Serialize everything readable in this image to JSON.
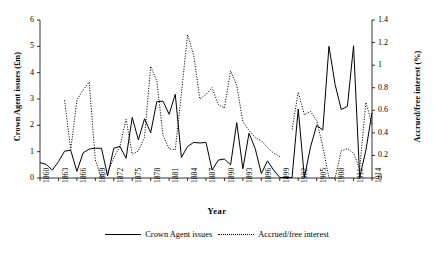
{
  "chart_data": {
    "type": "line",
    "title": "",
    "xlabel": "Year",
    "ylabel": "Crown Agent issues (£m)",
    "y2label": "Accrued/free interest (%)",
    "ylim": [
      0,
      6
    ],
    "y2lim": [
      0,
      1.4
    ],
    "xlim": [
      1860,
      1914
    ],
    "grid": false,
    "legend_position": "below",
    "y_ticks": [
      "0",
      "1",
      "2",
      "3",
      "4",
      "5",
      "6"
    ],
    "y2_ticks": [
      "0",
      "0.2",
      "0.4",
      "0.6",
      "0.8",
      "1",
      "1.2",
      "1.4"
    ],
    "x_ticks": [
      "1860",
      "1863",
      "1866",
      "1869",
      "1872",
      "1875",
      "1878",
      "1881",
      "1884",
      "1887",
      "1890",
      "1893",
      "1896",
      "1899",
      "1902",
      "1905",
      "1908",
      "1911",
      "1914"
    ],
    "x": [
      1860,
      1861,
      1862,
      1863,
      1864,
      1865,
      1866,
      1867,
      1868,
      1869,
      1870,
      1871,
      1872,
      1873,
      1874,
      1875,
      1876,
      1877,
      1878,
      1879,
      1880,
      1881,
      1882,
      1883,
      1884,
      1885,
      1886,
      1887,
      1888,
      1889,
      1890,
      1891,
      1892,
      1893,
      1894,
      1895,
      1896,
      1897,
      1898,
      1899,
      1900,
      1901,
      1902,
      1903,
      1904,
      1905,
      1906,
      1907,
      1908,
      1909,
      1910,
      1911,
      1912,
      1913,
      1914
    ],
    "series": [
      {
        "name": "Crown Agent issues",
        "axis": "left",
        "style": "solid",
        "color": "#000000",
        "unit": "£m",
        "values": [
          0.58,
          0.52,
          0.3,
          0.62,
          1.02,
          1.05,
          0.25,
          0.95,
          1.1,
          1.13,
          1.13,
          0.08,
          1.13,
          1.2,
          0.75,
          2.3,
          1.45,
          2.25,
          1.72,
          2.9,
          2.92,
          2.42,
          3.18,
          0.78,
          1.2,
          1.35,
          1.33,
          1.35,
          0.3,
          0.68,
          0.72,
          0.5,
          2.1,
          0.35,
          1.7,
          1.12,
          0.17,
          0.65,
          0.3,
          0.02,
          0.02,
          0.02,
          2.62,
          0.02,
          1.18,
          2.0,
          1.82,
          5.0,
          3.55,
          2.6,
          2.72,
          5.02,
          0.02,
          1.05,
          2.48
        ]
      },
      {
        "name": "Accrued/free interest",
        "axis": "right",
        "style": "dotted",
        "color": "#000000",
        "unit": "%",
        "values": [
          null,
          null,
          null,
          null,
          0.69,
          0.25,
          0.69,
          0.78,
          0.85,
          0.16,
          0.0,
          0.05,
          0.18,
          0.28,
          0.52,
          0.21,
          0.24,
          0.36,
          0.99,
          0.86,
          0.38,
          0.26,
          0.25,
          0.75,
          1.27,
          1.09,
          0.7,
          0.74,
          0.8,
          0.65,
          0.62,
          0.95,
          0.82,
          0.5,
          0.42,
          0.36,
          0.33,
          0.27,
          0.22,
          0.19,
          null,
          0.43,
          0.76,
          0.56,
          0.59,
          0.51,
          0.28,
          0.0,
          0.0,
          0.24,
          0.26,
          0.22,
          0.08,
          0.67,
          0.48
        ]
      }
    ]
  },
  "legend": {
    "items": [
      {
        "label": "Crown Agent issues",
        "marker": "solid-line"
      },
      {
        "label": "Accrued/free interest",
        "marker": "dotted-line"
      }
    ]
  }
}
